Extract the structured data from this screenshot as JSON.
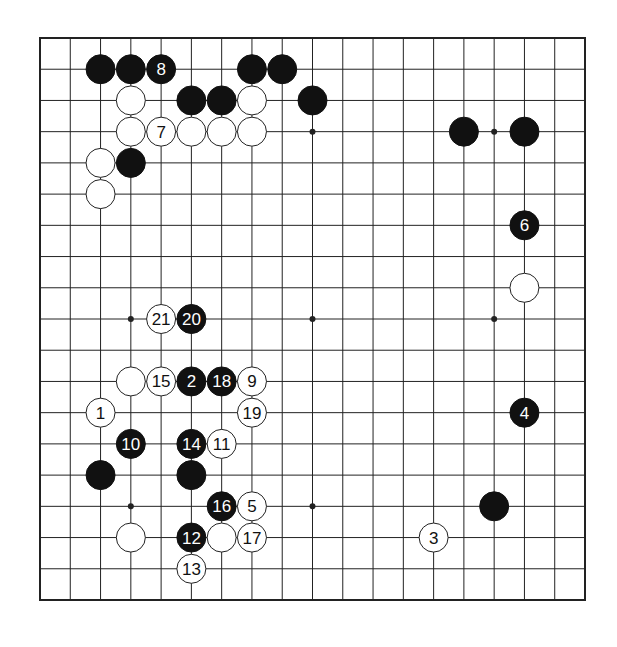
{
  "diagram": {
    "type": "go-board",
    "size": 19,
    "colors": {
      "background": "#ffffff",
      "line": "#222222",
      "black_stone": "#111111",
      "white_stone": "#ffffff",
      "black_label": "#ffffff",
      "white_label": "#111111"
    },
    "star_points": [
      [
        3,
        3
      ],
      [
        9,
        3
      ],
      [
        15,
        3
      ],
      [
        3,
        9
      ],
      [
        9,
        9
      ],
      [
        15,
        9
      ],
      [
        3,
        15
      ],
      [
        9,
        15
      ],
      [
        15,
        15
      ]
    ],
    "stones": [
      {
        "col": 2,
        "row": 1,
        "color": "black",
        "label": ""
      },
      {
        "col": 3,
        "row": 1,
        "color": "black",
        "label": ""
      },
      {
        "col": 4,
        "row": 1,
        "color": "black",
        "label": "8"
      },
      {
        "col": 7,
        "row": 1,
        "color": "black",
        "label": ""
      },
      {
        "col": 8,
        "row": 1,
        "color": "black",
        "label": ""
      },
      {
        "col": 3,
        "row": 2,
        "color": "white",
        "label": ""
      },
      {
        "col": 5,
        "row": 2,
        "color": "black",
        "label": ""
      },
      {
        "col": 6,
        "row": 2,
        "color": "black",
        "label": ""
      },
      {
        "col": 7,
        "row": 2,
        "color": "white",
        "label": ""
      },
      {
        "col": 9,
        "row": 2,
        "color": "black",
        "label": ""
      },
      {
        "col": 3,
        "row": 3,
        "color": "white",
        "label": ""
      },
      {
        "col": 4,
        "row": 3,
        "color": "white",
        "label": "7"
      },
      {
        "col": 5,
        "row": 3,
        "color": "white",
        "label": ""
      },
      {
        "col": 6,
        "row": 3,
        "color": "white",
        "label": ""
      },
      {
        "col": 7,
        "row": 3,
        "color": "white",
        "label": ""
      },
      {
        "col": 14,
        "row": 3,
        "color": "black",
        "label": ""
      },
      {
        "col": 16,
        "row": 3,
        "color": "black",
        "label": ""
      },
      {
        "col": 2,
        "row": 4,
        "color": "white",
        "label": ""
      },
      {
        "col": 3,
        "row": 4,
        "color": "black",
        "label": ""
      },
      {
        "col": 2,
        "row": 5,
        "color": "white",
        "label": ""
      },
      {
        "col": 16,
        "row": 6,
        "color": "black",
        "label": "6"
      },
      {
        "col": 16,
        "row": 8,
        "color": "white",
        "label": ""
      },
      {
        "col": 4,
        "row": 9,
        "color": "white",
        "label": "21"
      },
      {
        "col": 5,
        "row": 9,
        "color": "black",
        "label": "20"
      },
      {
        "col": 3,
        "row": 11,
        "color": "white",
        "label": ""
      },
      {
        "col": 4,
        "row": 11,
        "color": "white",
        "label": "15"
      },
      {
        "col": 5,
        "row": 11,
        "color": "black",
        "label": "2"
      },
      {
        "col": 6,
        "row": 11,
        "color": "black",
        "label": "18"
      },
      {
        "col": 7,
        "row": 11,
        "color": "white",
        "label": "9"
      },
      {
        "col": 2,
        "row": 12,
        "color": "white",
        "label": "1"
      },
      {
        "col": 7,
        "row": 12,
        "color": "white",
        "label": "19"
      },
      {
        "col": 16,
        "row": 12,
        "color": "black",
        "label": "4"
      },
      {
        "col": 3,
        "row": 13,
        "color": "black",
        "label": "10"
      },
      {
        "col": 5,
        "row": 13,
        "color": "black",
        "label": "14"
      },
      {
        "col": 6,
        "row": 13,
        "color": "white",
        "label": "11"
      },
      {
        "col": 2,
        "row": 14,
        "color": "black",
        "label": ""
      },
      {
        "col": 5,
        "row": 14,
        "color": "black",
        "label": ""
      },
      {
        "col": 6,
        "row": 15,
        "color": "black",
        "label": "16"
      },
      {
        "col": 7,
        "row": 15,
        "color": "white",
        "label": "5"
      },
      {
        "col": 15,
        "row": 15,
        "color": "black",
        "label": ""
      },
      {
        "col": 3,
        "row": 16,
        "color": "white",
        "label": ""
      },
      {
        "col": 5,
        "row": 16,
        "color": "black",
        "label": "12"
      },
      {
        "col": 6,
        "row": 16,
        "color": "white",
        "label": ""
      },
      {
        "col": 7,
        "row": 16,
        "color": "white",
        "label": "17"
      },
      {
        "col": 13,
        "row": 16,
        "color": "white",
        "label": "3"
      },
      {
        "col": 5,
        "row": 17,
        "color": "white",
        "label": "13"
      }
    ]
  }
}
